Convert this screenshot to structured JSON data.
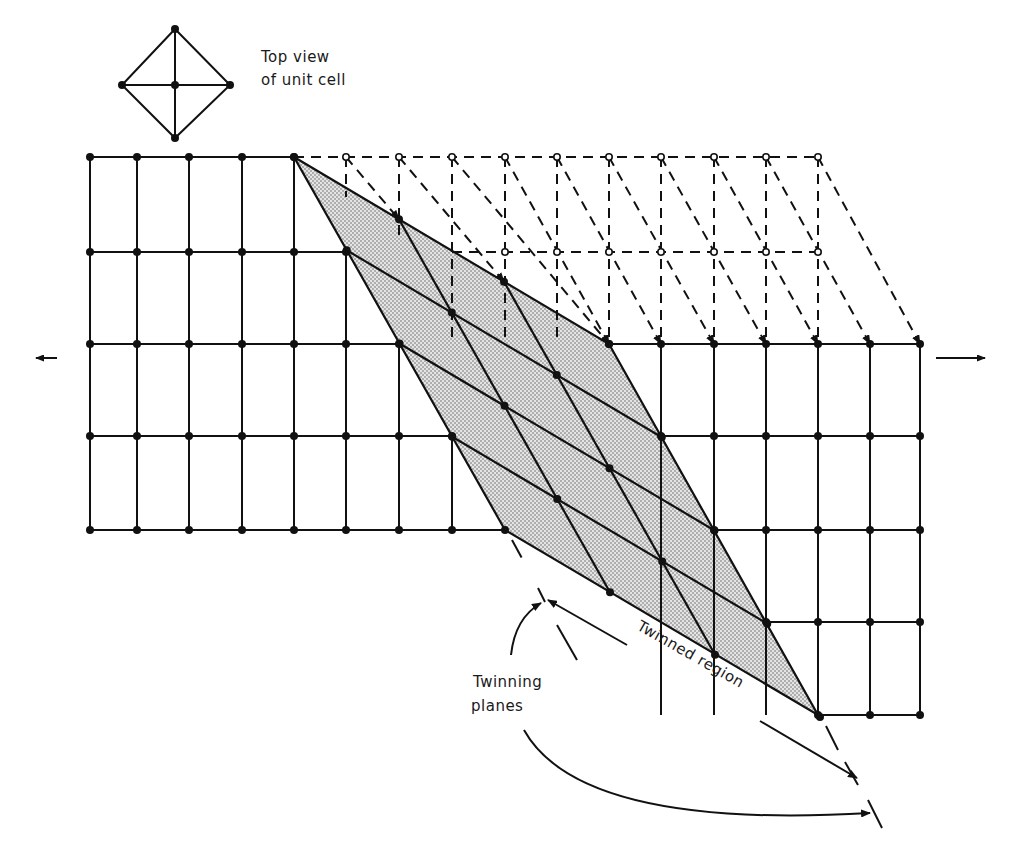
{
  "figure": {
    "inset_label_line1": "Top view",
    "inset_label_line2": "of unit cell",
    "twinning_label_line1": "Twinning",
    "twinning_label_line2": "planes",
    "twinned_region_label": "Twinned region"
  },
  "style": {
    "line_color": "#111111",
    "shade_color": "#d6d6d6",
    "background": "#ffffff"
  },
  "lattice": {
    "columns_x": [
      90,
      137,
      189,
      242,
      294,
      346,
      399,
      452,
      505,
      557,
      609,
      661,
      714,
      766,
      818,
      870,
      920
    ],
    "rows_y": [
      157,
      252,
      344,
      436,
      530,
      622,
      715
    ],
    "twin_corners": [
      [
        294,
        157
      ],
      [
        609,
        344
      ],
      [
        818,
        715
      ],
      [
        505,
        530
      ]
    ],
    "twin_divisions_a": 3,
    "twin_divisions_b": 4
  }
}
